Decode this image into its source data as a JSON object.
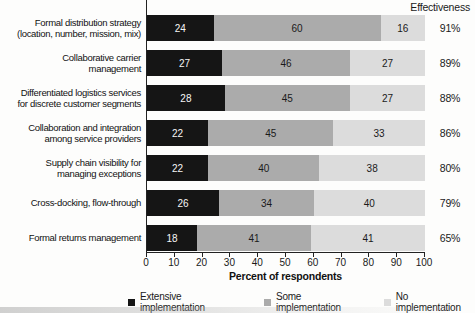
{
  "header": {
    "effectiveness_label": "Effectiveness"
  },
  "chart_data": {
    "type": "bar",
    "orientation": "horizontal-stacked",
    "title": "",
    "xlabel": "Percent of respondents",
    "ylabel": "",
    "xlim": [
      0,
      100
    ],
    "x_ticks": [
      0,
      10,
      20,
      30,
      40,
      50,
      60,
      70,
      80,
      90,
      100
    ],
    "grid": false,
    "legend_position": "bottom",
    "categories": [
      [
        "Formal distribution strategy",
        "(location, number, mission, mix)"
      ],
      [
        "Collaborative carrier",
        "management"
      ],
      [
        "Differentiated logistics services",
        "for discrete customer segments"
      ],
      [
        "Collaboration and integration",
        "among service providers"
      ],
      [
        "Supply chain visibility for",
        "managing exceptions"
      ],
      [
        "Cross-docking, flow-through"
      ],
      [
        "Formal returns management"
      ]
    ],
    "series": [
      {
        "name": "Extensive implementation",
        "color": "#151515",
        "text_color": "#f5f5f5",
        "values": [
          24,
          27,
          28,
          22,
          22,
          26,
          18
        ]
      },
      {
        "name": "Some implementation",
        "color": "#ababab",
        "text_color": "#1a1a1a",
        "values": [
          60,
          46,
          45,
          45,
          40,
          34,
          41
        ]
      },
      {
        "name": "No implementation",
        "color": "#dcdcdc",
        "text_color": "#1a1a1a",
        "values": [
          16,
          27,
          27,
          33,
          38,
          40,
          41
        ]
      }
    ],
    "effectiveness_column": {
      "header": "Effectiveness",
      "values": [
        "91%",
        "89%",
        "88%",
        "86%",
        "80%",
        "79%",
        "65%"
      ]
    }
  }
}
